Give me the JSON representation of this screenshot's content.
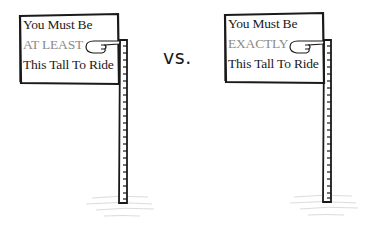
{
  "comparison": {
    "separator": "vs.",
    "signs": [
      {
        "line1": "You Must Be",
        "line2": "AT LEAST",
        "line3": "This Tall To Ride"
      },
      {
        "line1": "You Must Be",
        "line2": "EXACTLY",
        "line3": "This Tall To Ride"
      }
    ]
  },
  "colors": {
    "ink": "#1a1a1a",
    "emphasis_gray": "#8a8a8a",
    "background": "#ffffff"
  }
}
